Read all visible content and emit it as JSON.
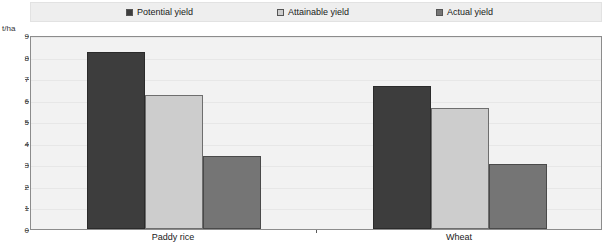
{
  "legend": {
    "position": "top",
    "items": [
      {
        "label": "Potential yield",
        "color": "#3d3d3d",
        "swatch_icon": "filled-square-icon"
      },
      {
        "label": "Attainable yield",
        "color": "#cdcdcd",
        "swatch_icon": "outlined-square-icon"
      },
      {
        "label": "Actual yield",
        "color": "#757575",
        "swatch_icon": "filled-square-icon"
      }
    ]
  },
  "axes": {
    "y_unit_label": "t/ha",
    "y_ticks": [
      "0",
      "1",
      "2",
      "3",
      "4",
      "5",
      "6",
      "7",
      "8",
      "9"
    ],
    "x_ticks": [
      "Paddy rice",
      "Wheat"
    ]
  },
  "chart_data": {
    "type": "bar",
    "title": "",
    "xlabel": "",
    "ylabel": "t/ha",
    "ylim": [
      0,
      9
    ],
    "ytick_step": 1,
    "grid": true,
    "legend_position": "top",
    "categories": [
      "Paddy rice",
      "Wheat"
    ],
    "series": [
      {
        "name": "Potential yield",
        "color": "#3d3d3d",
        "values": [
          8.2,
          6.65
        ]
      },
      {
        "name": "Attainable yield",
        "color": "#cdcdcd",
        "values": [
          6.2,
          5.6
        ]
      },
      {
        "name": "Actual yield",
        "color": "#757575",
        "values": [
          3.4,
          3.0
        ]
      }
    ]
  }
}
